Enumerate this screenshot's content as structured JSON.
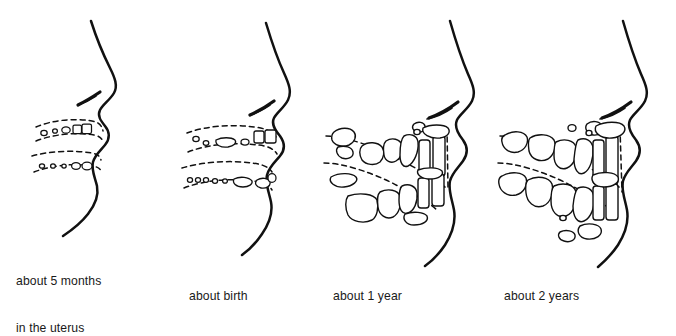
{
  "figure": {
    "type": "line-drawing",
    "background_color": "#ffffff",
    "ink_color": "#111111",
    "panel_count": 4
  },
  "panels": [
    {
      "index": 1,
      "caption_lines": [
        "about 5 months",
        "in the uterus"
      ],
      "stage": "prenatal-5-months",
      "upper_tooth_buds": 5,
      "lower_tooth_buds": 5,
      "jaw_arches": 2,
      "description": "infant profile with two dashed jaw arcs containing tiny oval tooth buds"
    },
    {
      "index": 2,
      "caption_lines": [
        "about birth"
      ],
      "stage": "birth",
      "upper_tooth_buds": 6,
      "lower_tooth_buds": 8,
      "jaw_arches": 2,
      "description": "infant profile with enlarged tooth buds inside dashed jaw arcs"
    },
    {
      "index": 3,
      "caption_lines": [
        "about 1 year"
      ],
      "stage": "one-year",
      "upper_tooth_buds": 9,
      "lower_tooth_buds": 8,
      "jaw_arches": 2,
      "description": "child profile with erupting incisors and developing molars and canines"
    },
    {
      "index": 4,
      "caption_lines": [
        "about 2 years"
      ],
      "stage": "two-years",
      "upper_tooth_buds": 12,
      "lower_tooth_buds": 12,
      "jaw_arches": 2,
      "description": "child profile with a full primary dentition and permanent successors below"
    }
  ]
}
